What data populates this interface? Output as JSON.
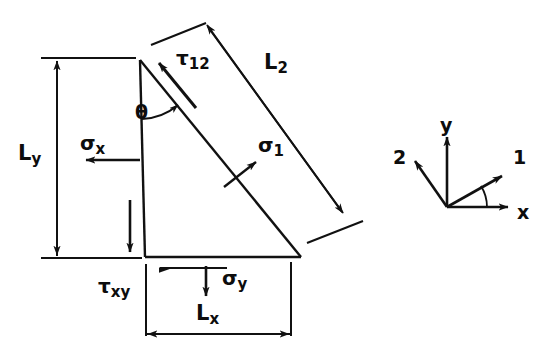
{
  "figure": {
    "stroke_color": "#111111",
    "background_color": "#ffffff",
    "labels": {
      "tau_12": {
        "base": "τ",
        "sub": "12",
        "x": 176,
        "y": 48
      },
      "L_2": {
        "base": "L",
        "sub": "2",
        "x": 264,
        "y": 52
      },
      "theta": {
        "base": "θ",
        "sub": "",
        "x": 135,
        "y": 103
      },
      "sigma_x": {
        "base": "σ",
        "sub": "x",
        "x": 80,
        "y": 133
      },
      "sigma_1": {
        "base": "σ",
        "sub": "1",
        "x": 258,
        "y": 135
      },
      "L_y": {
        "base": "L",
        "sub": "y",
        "x": 18,
        "y": 143
      },
      "tau_xy": {
        "base": "τ",
        "sub": "xy",
        "x": 98,
        "y": 276
      },
      "sigma_y": {
        "base": "σ",
        "sub": "y",
        "x": 222,
        "y": 268
      },
      "L_x": {
        "base": "L",
        "sub": "x",
        "x": 196,
        "y": 303
      }
    },
    "axes_inset": {
      "origin_x": 447,
      "origin_y": 207,
      "labels": {
        "y": {
          "text": "y",
          "x": 440,
          "y": 116
        },
        "x": {
          "text": "x",
          "x": 517,
          "y": 203
        },
        "one": {
          "text": "1",
          "x": 513,
          "y": 148
        },
        "two": {
          "text": "2",
          "x": 393,
          "y": 148
        }
      }
    },
    "geometry": {
      "apex": {
        "x": 139,
        "y": 60
      },
      "bottom_left": {
        "x": 145,
        "y": 256
      },
      "bottom_right": {
        "x": 301,
        "y": 256
      }
    }
  }
}
